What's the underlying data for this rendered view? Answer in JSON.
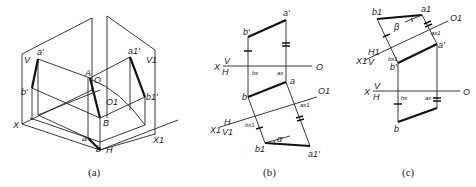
{
  "figure": {
    "panels": [
      {
        "id": "a",
        "caption": "(a)",
        "labels": {
          "V": "V",
          "a_prime": "a'",
          "b_prime": "b'",
          "A": "A",
          "O": "O",
          "O1": "O1",
          "a1_prime": "a1'",
          "b1_prime": "b1'",
          "V1": "V1",
          "X": "X",
          "B": "B",
          "a": "a",
          "b": "b",
          "H": "H",
          "X1": "X1"
        }
      },
      {
        "id": "b",
        "caption": "(b)",
        "labels": {
          "a_prime": "a'",
          "b_prime": "b'",
          "X": "X",
          "V": "V",
          "H": "H",
          "b_x": "bx",
          "a_x": "ax",
          "O": "O",
          "a": "a",
          "b": "b",
          "O1": "O1",
          "a_x1": "ax1",
          "X1": "X1",
          "H1": "H",
          "V1": "V1",
          "b_x1": "bx1",
          "b1": "b1",
          "alpha": "α",
          "a1_prime": "a1'"
        }
      },
      {
        "id": "c",
        "caption": "(c)",
        "labels": {
          "b1": "b1",
          "a1": "a1",
          "beta": "β",
          "O1": "O1",
          "a_x1": "ax1",
          "a_prime": "a'",
          "X1": "X1",
          "H1": "H1",
          "V": "V",
          "b_x1": "bx1",
          "b_prime": "b'",
          "X": "X",
          "V2": "V",
          "H": "H",
          "O": "O",
          "b_x": "bx",
          "a_x": "ax",
          "b": "b"
        }
      }
    ]
  }
}
